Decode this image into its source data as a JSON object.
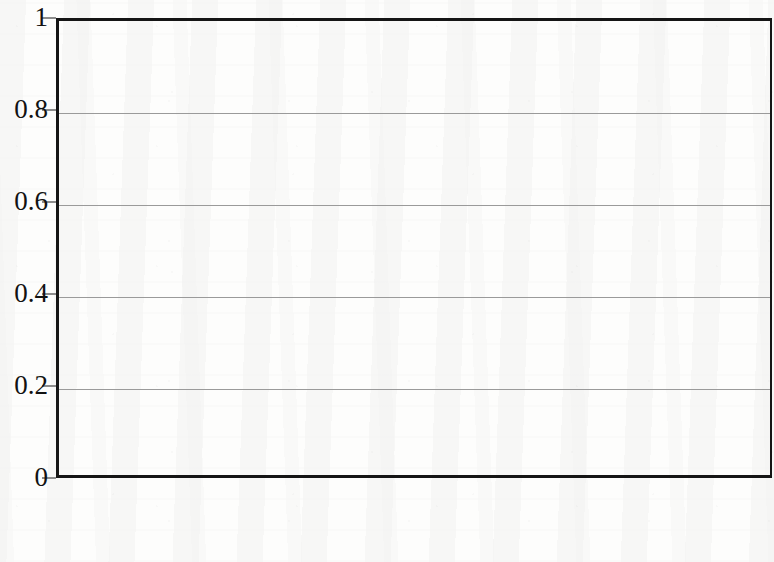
{
  "chart_data": {
    "type": "bar",
    "title": "",
    "subtitle": "",
    "xlabel": "",
    "ylabel": "",
    "categories": [
      "Democrats",
      "Republicans"
    ],
    "series": [
      {
        "name": "Positive",
        "color": "#3a3a3a",
        "values": [
          0.456,
          0.463
        ]
      },
      {
        "name": "Negative",
        "color": "#bdbdbd",
        "values": [
          0.557,
          0.472
        ]
      }
    ],
    "ylim": [
      0,
      1
    ],
    "yticks": [
      0,
      0.2,
      0.4,
      0.6,
      0.8,
      1
    ],
    "ytick_labels": [
      "0",
      "0.2",
      "0.4",
      "0.6",
      "0.8",
      "1"
    ],
    "grid": "horizontal",
    "legend_position": "bottom",
    "bar_grouping": "adjacent-no-gap",
    "frame": "box"
  },
  "axis": {
    "y_ticks": [
      {
        "label": "1",
        "value": 1
      },
      {
        "label": "0.8",
        "value": 0.8
      },
      {
        "label": "0.6",
        "value": 0.6
      },
      {
        "label": "0.4",
        "value": 0.4
      },
      {
        "label": "0.2",
        "value": 0.2
      },
      {
        "label": "0",
        "value": 0
      }
    ]
  },
  "categories": [
    {
      "label": "Democrats"
    },
    {
      "label": "Republicans"
    }
  ],
  "legend": {
    "items": [
      {
        "label": "Positive",
        "color": "#3a3a3a"
      },
      {
        "label": "Negative",
        "color": "#bdbdbd"
      }
    ]
  }
}
